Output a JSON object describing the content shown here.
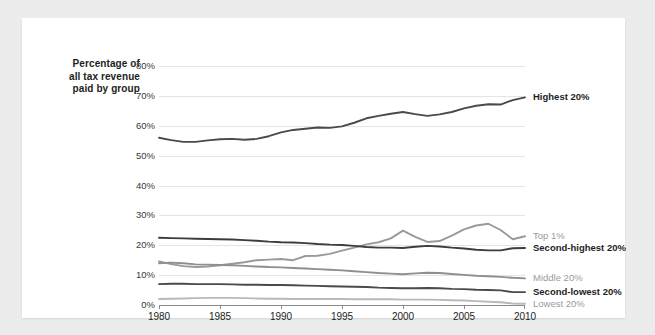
{
  "axis_title": {
    "line1": "Percentage of",
    "line2": "all tax revenue",
    "line3": "paid by group"
  },
  "colors": {
    "highest": "#4a4a4a",
    "second_highest": "#3d3d3d",
    "top1": "#9a9a9c",
    "middle": "#8f8f91",
    "second_lowest": "#4a4a4a",
    "lowest": "#b9b9bb",
    "grid": "#e4e4e6",
    "axis": "#8c8c8e",
    "card": "#ffffff",
    "page": "#ececed"
  },
  "chart_data": {
    "type": "line",
    "title": "",
    "subtitle": "",
    "xlabel": "",
    "ylabel": "Percentage of all tax revenue paid by group",
    "xlim": [
      1980,
      2010
    ],
    "ylim": [
      0,
      80
    ],
    "grid": true,
    "legend_position": "right-inline",
    "x_ticks": [
      1980,
      1985,
      1990,
      1995,
      2000,
      2005,
      2010
    ],
    "x_tick_labels": [
      "1980",
      "1985",
      "1990",
      "1995",
      "2000",
      "2005",
      "2010"
    ],
    "y_ticks": [
      0,
      10,
      20,
      30,
      40,
      50,
      60,
      70,
      80
    ],
    "y_tick_labels": [
      "0%",
      "10%",
      "20%",
      "30%",
      "40%",
      "50%",
      "60%",
      "70%",
      "80%"
    ],
    "x": [
      1980,
      1981,
      1982,
      1983,
      1984,
      1985,
      1986,
      1987,
      1988,
      1989,
      1990,
      1991,
      1992,
      1993,
      1994,
      1995,
      1996,
      1997,
      1998,
      1999,
      2000,
      2001,
      2002,
      2003,
      2004,
      2005,
      2006,
      2007,
      2008,
      2009,
      2010
    ],
    "series": [
      {
        "name": "Highest 20%",
        "color": "#4a4a4a",
        "label_color": "dark",
        "values": [
          56.0,
          55.2,
          54.6,
          54.6,
          55.1,
          55.5,
          55.6,
          55.3,
          55.6,
          56.5,
          57.8,
          58.6,
          59.0,
          59.4,
          59.3,
          59.8,
          61.0,
          62.5,
          63.3,
          64.0,
          64.6,
          63.9,
          63.3,
          63.8,
          64.6,
          65.8,
          66.7,
          67.2,
          67.1,
          68.6,
          69.5
        ]
      },
      {
        "name": "Top 1%",
        "color": "#9a9a9c",
        "label_color": "gray",
        "values": [
          14.6,
          13.7,
          13.0,
          12.7,
          12.9,
          13.3,
          13.8,
          14.3,
          15.0,
          15.2,
          15.4,
          15.0,
          16.4,
          16.5,
          17.1,
          18.2,
          19.2,
          20.3,
          21.0,
          22.3,
          24.9,
          22.8,
          21.1,
          21.4,
          23.2,
          25.3,
          26.6,
          27.2,
          25.1,
          22.0,
          23.0
        ]
      },
      {
        "name": "Second-highest 20%",
        "color": "#3d3d3d",
        "label_color": "dark",
        "values": [
          22.5,
          22.4,
          22.3,
          22.2,
          22.1,
          22.0,
          21.9,
          21.7,
          21.5,
          21.2,
          21.0,
          20.9,
          20.7,
          20.4,
          20.2,
          20.1,
          19.8,
          19.4,
          19.2,
          19.2,
          19.1,
          19.5,
          19.8,
          19.6,
          19.2,
          18.9,
          18.5,
          18.3,
          18.3,
          19.0,
          19.1
        ]
      },
      {
        "name": "Middle 20%",
        "color": "#8f8f91",
        "label_color": "gray",
        "values": [
          14.0,
          14.2,
          14.0,
          13.6,
          13.5,
          13.4,
          13.3,
          13.1,
          12.9,
          12.7,
          12.6,
          12.4,
          12.2,
          12.0,
          11.8,
          11.6,
          11.3,
          11.0,
          10.7,
          10.5,
          10.3,
          10.6,
          10.8,
          10.7,
          10.4,
          10.1,
          9.8,
          9.6,
          9.4,
          9.1,
          8.9
        ]
      },
      {
        "name": "Second-lowest 20%",
        "color": "#4a4a4a",
        "label_color": "dark",
        "values": [
          7.0,
          7.1,
          7.1,
          7.0,
          7.0,
          7.0,
          6.9,
          6.8,
          6.8,
          6.7,
          6.7,
          6.6,
          6.5,
          6.4,
          6.3,
          6.2,
          6.1,
          6.0,
          5.8,
          5.7,
          5.6,
          5.6,
          5.7,
          5.6,
          5.4,
          5.3,
          5.1,
          5.0,
          4.9,
          4.3,
          4.3
        ]
      },
      {
        "name": "Lowest 20%",
        "color": "#b9b9bb",
        "label_color": "gray",
        "values": [
          2.0,
          2.1,
          2.2,
          2.3,
          2.4,
          2.4,
          2.4,
          2.3,
          2.2,
          2.1,
          2.1,
          2.0,
          2.0,
          2.0,
          2.0,
          2.0,
          1.9,
          1.9,
          1.9,
          1.9,
          1.8,
          1.8,
          1.8,
          1.7,
          1.6,
          1.5,
          1.3,
          1.1,
          0.9,
          0.5,
          0.4
        ]
      }
    ]
  },
  "series_labels": [
    {
      "text": "Highest 20%",
      "style": "dark"
    },
    {
      "text": "Top 1%",
      "style": "gray"
    },
    {
      "text": "Second-highest 20%",
      "style": "dark"
    },
    {
      "text": "Middle 20%",
      "style": "gray"
    },
    {
      "text": "Second-lowest 20%",
      "style": "dark"
    },
    {
      "text": "Lowest 20%",
      "style": "gray"
    }
  ]
}
